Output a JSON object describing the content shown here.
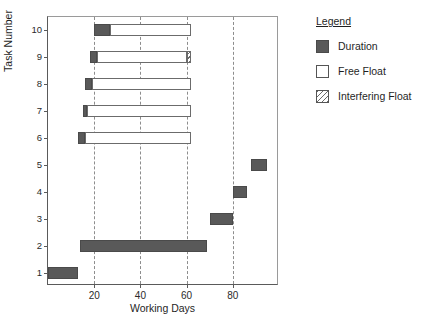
{
  "chart_data": {
    "type": "bar",
    "title": "",
    "xlabel": "Working Days",
    "ylabel": "Task Number",
    "xlim": [
      0,
      100
    ],
    "ylim": [
      0.5,
      10.5
    ],
    "grid": "vertical-dashed-at-xticks",
    "xticks": [
      20,
      40,
      60,
      80
    ],
    "xtick_labels": [
      "20",
      "40",
      "60",
      "80"
    ],
    "yticks": [
      1,
      2,
      3,
      4,
      5,
      6,
      7,
      8,
      9,
      10
    ],
    "ytick_labels": [
      "1",
      "2",
      "3",
      "4",
      "5",
      "6",
      "7",
      "8",
      "9",
      "10"
    ],
    "orientation": "horizontal",
    "series": [
      {
        "name": "Duration",
        "color": "#595959",
        "fill": "solid"
      },
      {
        "name": "Free Float",
        "color": "#ffffff",
        "fill": "empty"
      },
      {
        "name": "Interfering Float",
        "color": "#ffffff",
        "fill": "hatched"
      }
    ],
    "tasks": [
      {
        "task": 10,
        "duration": [
          20,
          27
        ],
        "free_float": [
          27,
          62
        ],
        "interfering_float": null
      },
      {
        "task": 9,
        "duration": [
          18,
          21
        ],
        "free_float": [
          21,
          60
        ],
        "interfering_float": [
          60,
          62
        ]
      },
      {
        "task": 8,
        "duration": [
          16,
          19
        ],
        "free_float": [
          19,
          62
        ],
        "interfering_float": null
      },
      {
        "task": 7,
        "duration": [
          15,
          17
        ],
        "free_float": [
          17,
          62
        ],
        "interfering_float": null
      },
      {
        "task": 6,
        "duration": [
          13,
          16
        ],
        "free_float": [
          16,
          62
        ],
        "interfering_float": null
      },
      {
        "task": 5,
        "duration": [
          88,
          95
        ],
        "free_float": null,
        "interfering_float": null
      },
      {
        "task": 4,
        "duration": [
          80,
          86
        ],
        "free_float": null,
        "interfering_float": null
      },
      {
        "task": 3,
        "duration": [
          70,
          80
        ],
        "free_float": null,
        "interfering_float": null
      },
      {
        "task": 2,
        "duration": [
          14,
          69
        ],
        "free_float": null,
        "interfering_float": null
      },
      {
        "task": 1,
        "duration": [
          0,
          13
        ],
        "free_float": null,
        "interfering_float": null
      }
    ]
  },
  "legend": {
    "title": "Legend",
    "items": [
      {
        "label": "Duration",
        "swatch": "duration"
      },
      {
        "label": "Free Float",
        "swatch": "freefloat"
      },
      {
        "label": "Interfering Float",
        "swatch": "interfering"
      }
    ]
  },
  "colors": {
    "duration": "#595959",
    "free_float": "#ffffff",
    "axis": "#5a5a5a",
    "gridline": "#8d8d8d",
    "text": "#1f1f1f"
  }
}
